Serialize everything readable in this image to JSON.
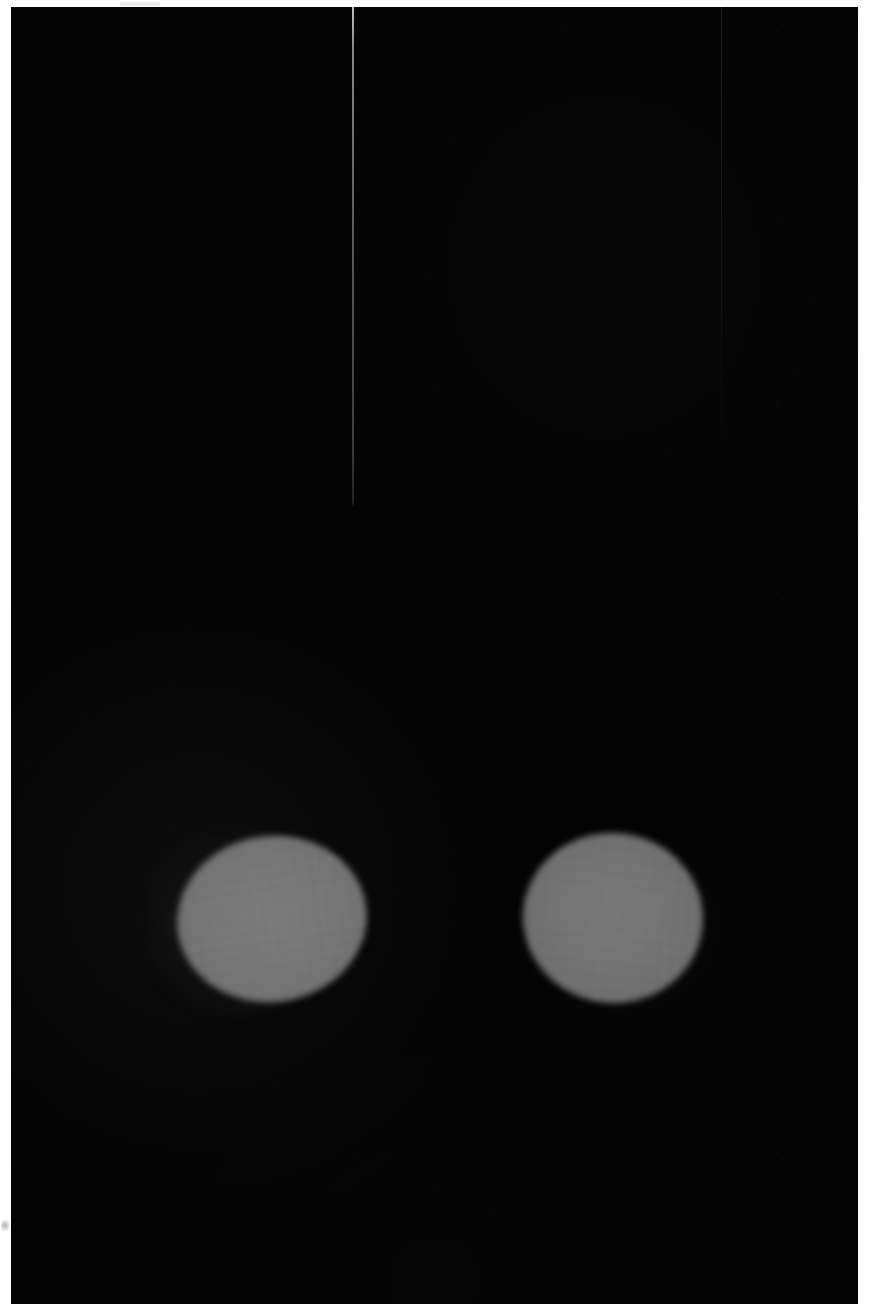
{
  "image": {
    "kind": "grayscale-scan",
    "width": 873,
    "height": 1304,
    "background_color": "#030303",
    "margin_color": "#ffffff",
    "caption": ""
  },
  "plate": {
    "label": "",
    "left": 11,
    "top": 7,
    "width": 847,
    "height": 1297,
    "fill": "#030303"
  },
  "margins": {
    "top_height": 7,
    "left_width": 11,
    "right_width": 15,
    "color": "#ffffff"
  },
  "reference_line": {
    "name": "vertical-reference-line",
    "x": 352,
    "y_start": 0,
    "y_end": 500,
    "width": 2,
    "color": "#d2d2d2"
  },
  "panel_seam": {
    "name": "faint-vertical-seam",
    "x": 721,
    "y_start": 0,
    "y_end": 470,
    "width": 1
  },
  "regions": [
    {
      "id": "roi-left",
      "label": "",
      "center_x": 272,
      "center_y": 919,
      "width": 190,
      "height": 166,
      "rotation_deg": -8,
      "fill": "#757575",
      "edge_softness_px": 3,
      "has_halo": true
    },
    {
      "id": "roi-right",
      "label": "",
      "center_x": 613,
      "center_y": 918,
      "width": 180,
      "height": 170,
      "rotation_deg": 6,
      "fill": "#727272",
      "edge_softness_px": 3,
      "has_halo": true
    }
  ],
  "artifacts": [
    {
      "id": "scan-blemish",
      "x": 1,
      "y": 1219,
      "width": 8,
      "height": 13
    },
    {
      "id": "top-edge-artifact",
      "x": 120,
      "y": 2,
      "width": 40,
      "height": 4
    }
  ],
  "chart_data": {
    "type": "heatmap",
    "title": "",
    "xlabel": "",
    "ylabel": "",
    "grid": false,
    "legend": "none",
    "xlim": [
      0,
      873
    ],
    "ylim": [
      0,
      1304
    ],
    "colormap": "grayscale",
    "value_range": [
      3,
      120
    ],
    "background_value": 3,
    "features": [
      {
        "name": "left-bright-ellipse",
        "cx": 272,
        "cy": 919,
        "rx": 95,
        "ry": 83,
        "value": 117
      },
      {
        "name": "right-bright-ellipse",
        "cx": 613,
        "cy": 918,
        "rx": 90,
        "ry": 85,
        "value": 114
      },
      {
        "name": "left-ellipse-halo",
        "cx": 222,
        "cy": 913,
        "rx": 90,
        "ry": 95,
        "value": 28
      },
      {
        "name": "vertical-line",
        "cx": 353,
        "cy": 250,
        "rx": 1,
        "ry": 250,
        "value": 140
      }
    ]
  }
}
